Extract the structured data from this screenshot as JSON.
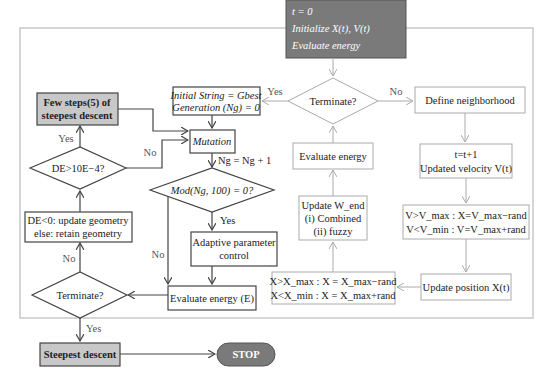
{
  "diagram": {
    "type": "flowchart",
    "start_block": {
      "line1": "t = 0",
      "line2": "Initialize X(t), V(t)",
      "line3": "Evaluate energy"
    },
    "nodes": {
      "few_steps": {
        "line1": "Few steps(5) of",
        "line2": "steepest descent"
      },
      "de_check": {
        "label": "DE>10E−4?"
      },
      "update_geometry": {
        "line1": "DE<0: update geometry",
        "line2": "else: retain geometry"
      },
      "terminate_left": {
        "label": "Terminate?"
      },
      "steepest_descent": {
        "label": "Steepest descent"
      },
      "stop": {
        "label": "STOP"
      },
      "initial_string": {
        "line1": "Initial String = Gbest",
        "line2": "Generation (Ng) = 0"
      },
      "mutation": {
        "label": "Mutation"
      },
      "ng_increment": {
        "label": "Ng = Ng + 1"
      },
      "mod_check": {
        "label": "Mod(Ng, 100) = 0?"
      },
      "adaptive": {
        "line1": "Adaptive parameter",
        "line2": "control"
      },
      "evaluate_energy_e": {
        "label": "Evaluate energy (E)"
      },
      "terminate_top": {
        "label": "Terminate?"
      },
      "evaluate_energy": {
        "label": "Evaluate energy"
      },
      "update_w_end": {
        "line1": "Update W_end",
        "line2": "(i) Combined",
        "line3": "(ii) fuzzy"
      },
      "x_bounds": {
        "line1": "X>X_max : X = X_max−rand",
        "line2": "X<X_min : X = X_max+rand"
      },
      "define_neighborhood": {
        "label": "Define neighborhood"
      },
      "velocity_update": {
        "line1": "t=t+1",
        "line2": "Updated velocity V(t)"
      },
      "v_bounds": {
        "line1": "V>V_max : X=V_max−rand",
        "line2": "V<V_min : V=V_max+rand"
      },
      "update_position": {
        "label": "Update position X(t)"
      }
    },
    "edge_labels": {
      "yes_few_steps": "Yes",
      "no_de": "No",
      "no_terminate_left": "No",
      "yes_terminate_left": "Yes",
      "yes_terminate_top": "Yes",
      "no_terminate_top": "No",
      "yes_mod": "Yes",
      "no_mod": "No"
    },
    "colors": {
      "start_fill": "#7a7a7a",
      "gray_fill": "#c8c8c8",
      "dark_stroke": "#444444",
      "light_stroke": "#aaaaaa",
      "frame": "#c8c8c8"
    }
  }
}
